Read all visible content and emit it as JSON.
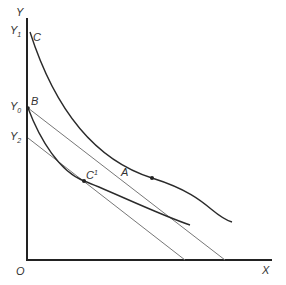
{
  "axes": {
    "y_label": "Y",
    "x_label": "X",
    "origin_label": "O",
    "y_ticks": [
      {
        "label": "Y",
        "sub": "1",
        "y": 32
      },
      {
        "label": "Y",
        "sub": "0",
        "y": 108
      },
      {
        "label": "Y",
        "sub": "2",
        "y": 138
      }
    ]
  },
  "points": {
    "C": {
      "label": "C",
      "x": 30,
      "y": 32
    },
    "B": {
      "label": "B",
      "x": 28,
      "y": 108
    },
    "A": {
      "label": "A",
      "x": 152,
      "y": 178
    },
    "C1": {
      "label": "C",
      "sup": "1",
      "x": 84,
      "y": 181
    }
  },
  "curves": {
    "upper_indifference": "M30,32 C55,110 95,160 152,178 S210,215 232,222",
    "lower_indifference": "M28,108 C40,140 60,172 84,181 S160,215 190,225",
    "budget_line_B": {
      "x1": 28,
      "y1": 108,
      "x2": 225,
      "y2": 260
    },
    "budget_line_Y2": {
      "x1": 28,
      "y1": 138,
      "x2": 185,
      "y2": 260
    }
  },
  "colors": {
    "axis": "#222222",
    "curve": "#2a2a2a",
    "line": "#777777"
  }
}
